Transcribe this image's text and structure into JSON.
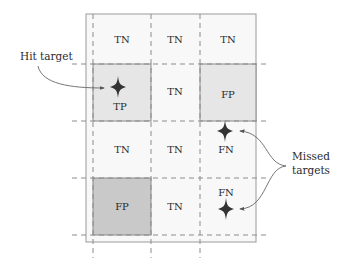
{
  "diagram": {
    "title": "",
    "grid": {
      "rows": [
        [
          {
            "label": "TN",
            "shade": "none"
          },
          {
            "label": "TN",
            "shade": "none"
          },
          {
            "label": "TN",
            "shade": "none"
          }
        ],
        [
          {
            "label": "TP",
            "shade": "light"
          },
          {
            "label": "TN",
            "shade": "none"
          },
          {
            "label": "FP",
            "shade": "light"
          }
        ],
        [
          {
            "label": "TN",
            "shade": "none"
          },
          {
            "label": "TN",
            "shade": "none"
          },
          {
            "label": "FN",
            "shade": "none"
          }
        ],
        [
          {
            "label": "FP",
            "shade": "dark"
          },
          {
            "label": "TN",
            "shade": "none"
          },
          {
            "label": "FN",
            "shade": "none"
          }
        ]
      ]
    },
    "cells": {
      "r0c0": "TN",
      "r0c1": "TN",
      "r0c2": "TN",
      "r1c0": "TP",
      "r1c1": "TN",
      "r1c2": "FP",
      "r2c0": "TN",
      "r2c1": "TN",
      "r2c2": "FN",
      "r3c0": "FP",
      "r3c1": "TN",
      "r3c2": "FN"
    },
    "annotations": {
      "hit_target": "Hit target",
      "missed_line1": "Missed",
      "missed_line2": "targets"
    },
    "targets": [
      {
        "name": "hit",
        "cell": "r1c0",
        "icon": "star-icon"
      },
      {
        "name": "missed-1",
        "cell": "r2c2",
        "icon": "star-icon"
      },
      {
        "name": "missed-2",
        "cell": "r3c2",
        "icon": "star-icon"
      }
    ],
    "colors": {
      "frame": "#9a9a9a",
      "dashed": "#8c8c8c",
      "shade_light": "#e6e6e6",
      "shade_dark": "#c9c9c9",
      "background_cell": "#f7f7f7",
      "star": "#333333",
      "text": "#2a2a2a"
    }
  }
}
